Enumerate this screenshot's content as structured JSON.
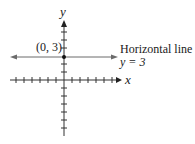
{
  "diagram": {
    "type": "coordinate-plane",
    "axes": {
      "x_label": "x",
      "y_label": "y"
    },
    "point": {
      "label": "(0, 3)",
      "x": 0,
      "y": 3
    },
    "line": {
      "title": "Horizontal line",
      "equation": "y = 3",
      "color": "#6b6b6b"
    },
    "colors": {
      "axis": "#333333",
      "line": "#6b6b6b",
      "point": "#111111"
    }
  }
}
